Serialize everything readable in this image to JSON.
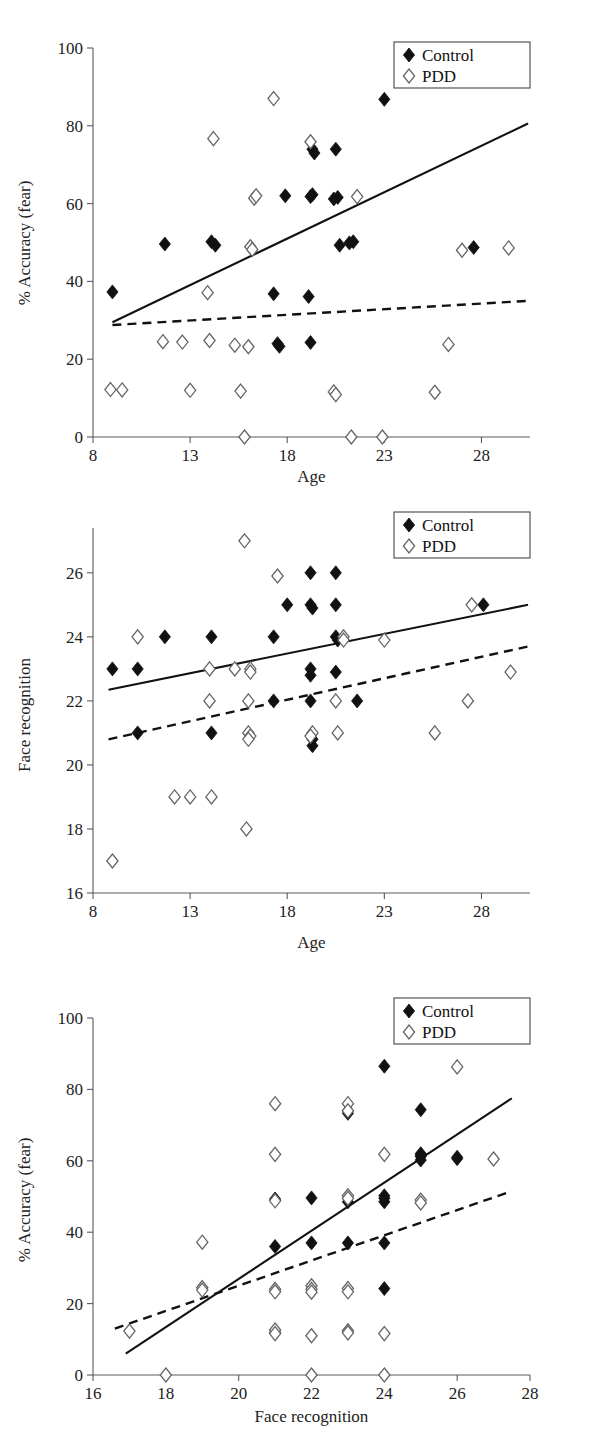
{
  "figure": {
    "panel_count": 3,
    "legend": {
      "control_label": "Control",
      "pdd_label": "PDD",
      "control_marker": "filled-diamond-icon",
      "pdd_marker": "open-diamond-icon"
    },
    "colors": {
      "control": "#111111",
      "pdd_outline": "#666666",
      "axis": "#5a5a5a",
      "background": "#ffffff"
    }
  },
  "chart_data": [
    {
      "id": "panel-1",
      "type": "scatter",
      "title": "",
      "xlabel": "Age",
      "ylabel": "% Accuracy (fear)",
      "xlim": [
        8,
        30.5
      ],
      "ylim": [
        0,
        100
      ],
      "xticks": [
        8,
        13,
        18,
        23,
        28
      ],
      "yticks": [
        0,
        20,
        40,
        60,
        80,
        100
      ],
      "grid": false,
      "legend_position": "top-right",
      "series": [
        {
          "name": "Control",
          "marker": "filled-diamond",
          "points": [
            [
              9.0,
              37.3
            ],
            [
              11.7,
              49.6
            ],
            [
              14.1,
              50.2
            ],
            [
              14.3,
              49.3
            ],
            [
              17.3,
              36.8
            ],
            [
              17.5,
              24.0
            ],
            [
              17.6,
              23.3
            ],
            [
              17.9,
              62.0
            ],
            [
              19.1,
              36.1
            ],
            [
              19.2,
              24.3
            ],
            [
              19.2,
              61.8
            ],
            [
              19.3,
              62.3
            ],
            [
              19.3,
              74.0
            ],
            [
              19.4,
              73.0
            ],
            [
              20.4,
              61.2
            ],
            [
              20.6,
              61.6
            ],
            [
              20.5,
              74.0
            ],
            [
              20.7,
              49.3
            ],
            [
              21.2,
              49.9
            ],
            [
              21.4,
              50.2
            ],
            [
              23.0,
              86.8
            ],
            [
              27.6,
              48.7
            ]
          ]
        },
        {
          "name": "PDD",
          "marker": "open-diamond",
          "points": [
            [
              8.9,
              12.2
            ],
            [
              9.5,
              12.1
            ],
            [
              11.6,
              24.5
            ],
            [
              12.6,
              24.4
            ],
            [
              13.0,
              12.0
            ],
            [
              13.9,
              37.1
            ],
            [
              14.0,
              24.8
            ],
            [
              14.2,
              76.7
            ],
            [
              15.3,
              23.6
            ],
            [
              15.6,
              11.8
            ],
            [
              15.8,
              0.0
            ],
            [
              16.0,
              23.2
            ],
            [
              16.1,
              48.9
            ],
            [
              16.2,
              48.2
            ],
            [
              16.3,
              61.4
            ],
            [
              16.4,
              62.0
            ],
            [
              17.3,
              87.0
            ],
            [
              19.2,
              75.9
            ],
            [
              20.4,
              11.6
            ],
            [
              20.5,
              10.9
            ],
            [
              21.3,
              0.0
            ],
            [
              21.6,
              61.8
            ],
            [
              22.9,
              0.0
            ],
            [
              25.6,
              11.5
            ],
            [
              26.3,
              23.8
            ],
            [
              27.0,
              48.0
            ],
            [
              29.4,
              48.6
            ]
          ]
        }
      ],
      "fit_lines": [
        {
          "group": "Control",
          "style": "solid",
          "x1": 9.0,
          "y1": 29.5,
          "x2": 30.4,
          "y2": 80.6
        },
        {
          "group": "PDD",
          "style": "dashed",
          "x1": 9.0,
          "y1": 28.8,
          "x2": 30.4,
          "y2": 35.0
        }
      ]
    },
    {
      "id": "panel-2",
      "type": "scatter",
      "title": "",
      "xlabel": "Age",
      "ylabel": "Face recognition",
      "xlim": [
        8,
        30.5
      ],
      "ylim": [
        16,
        27.4
      ],
      "xticks": [
        8,
        13,
        18,
        23,
        28
      ],
      "yticks": [
        16,
        18,
        20,
        22,
        24,
        26
      ],
      "grid": false,
      "legend_position": "top-right",
      "series": [
        {
          "name": "Control",
          "marker": "filled-diamond",
          "points": [
            [
              9.0,
              23.0
            ],
            [
              10.3,
              23.0
            ],
            [
              11.7,
              24.0
            ],
            [
              14.1,
              24.0
            ],
            [
              14.1,
              21.0
            ],
            [
              10.3,
              21.0
            ],
            [
              17.3,
              24.0
            ],
            [
              17.3,
              22.0
            ],
            [
              18.0,
              25.0
            ],
            [
              19.2,
              26.0
            ],
            [
              19.2,
              25.0
            ],
            [
              19.3,
              24.9
            ],
            [
              19.2,
              23.0
            ],
            [
              19.2,
              22.8
            ],
            [
              19.2,
              22.0
            ],
            [
              19.3,
              20.8
            ],
            [
              19.3,
              20.6
            ],
            [
              20.5,
              26.0
            ],
            [
              20.5,
              25.0
            ],
            [
              20.5,
              24.0
            ],
            [
              20.6,
              23.9
            ],
            [
              20.5,
              22.9
            ],
            [
              21.6,
              22.0
            ],
            [
              28.1,
              25.0
            ]
          ]
        },
        {
          "name": "PDD",
          "marker": "open-diamond",
          "points": [
            [
              9.0,
              17.0
            ],
            [
              10.3,
              24.0
            ],
            [
              12.2,
              19.0
            ],
            [
              13.0,
              19.0
            ],
            [
              14.1,
              19.0
            ],
            [
              14.0,
              22.0
            ],
            [
              14.0,
              23.0
            ],
            [
              15.3,
              23.0
            ],
            [
              15.8,
              27.0
            ],
            [
              15.9,
              18.0
            ],
            [
              16.0,
              22.0
            ],
            [
              16.1,
              23.0
            ],
            [
              16.1,
              22.9
            ],
            [
              16.0,
              21.0
            ],
            [
              16.1,
              20.9
            ],
            [
              16.0,
              20.8
            ],
            [
              17.5,
              25.9
            ],
            [
              19.3,
              21.0
            ],
            [
              19.2,
              20.9
            ],
            [
              20.5,
              22.0
            ],
            [
              20.6,
              21.0
            ],
            [
              20.9,
              24.0
            ],
            [
              20.9,
              23.9
            ],
            [
              23.0,
              23.9
            ],
            [
              25.6,
              21.0
            ],
            [
              27.3,
              22.0
            ],
            [
              27.5,
              25.0
            ],
            [
              29.5,
              22.9
            ]
          ]
        }
      ],
      "fit_lines": [
        {
          "group": "Control",
          "style": "solid",
          "x1": 8.8,
          "y1": 22.35,
          "x2": 30.4,
          "y2": 25.0
        },
        {
          "group": "PDD",
          "style": "dashed",
          "x1": 8.8,
          "y1": 20.8,
          "x2": 30.4,
          "y2": 23.7
        }
      ]
    },
    {
      "id": "panel-3",
      "type": "scatter",
      "title": "",
      "xlabel": "Face recognition",
      "ylabel": "% Accuracy (fear)",
      "xlim": [
        16,
        28
      ],
      "ylim": [
        0,
        100
      ],
      "xticks": [
        16,
        18,
        20,
        22,
        24,
        26,
        28
      ],
      "yticks": [
        0,
        20,
        40,
        60,
        80,
        100
      ],
      "grid": false,
      "legend_position": "top-right",
      "series": [
        {
          "name": "Control",
          "marker": "filled-diamond",
          "points": [
            [
              21.0,
              36.0
            ],
            [
              21.0,
              49.3
            ],
            [
              21.0,
              11.9
            ],
            [
              22.0,
              49.6
            ],
            [
              22.0,
              37.0
            ],
            [
              23.0,
              74.0
            ],
            [
              23.0,
              73.3
            ],
            [
              23.0,
              37.0
            ],
            [
              24.0,
              86.5
            ],
            [
              24.0,
              49.5
            ],
            [
              24.0,
              48.5
            ],
            [
              24.0,
              37.0
            ],
            [
              24.0,
              24.2
            ],
            [
              25.0,
              74.3
            ],
            [
              25.0,
              62.0
            ],
            [
              25.0,
              61.2
            ],
            [
              25.0,
              60.2
            ],
            [
              26.0,
              61.0
            ],
            [
              26.0,
              60.6
            ],
            [
              23.0,
              48.5
            ],
            [
              24.0,
              50.2
            ],
            [
              25.0,
              61.6
            ]
          ]
        },
        {
          "name": "PDD",
          "marker": "open-diamond",
          "points": [
            [
              17.0,
              12.3
            ],
            [
              18.0,
              0.0
            ],
            [
              19.0,
              37.2
            ],
            [
              19.0,
              24.5
            ],
            [
              19.0,
              23.8
            ],
            [
              21.0,
              76.0
            ],
            [
              21.0,
              61.8
            ],
            [
              21.0,
              48.8
            ],
            [
              21.0,
              24.0
            ],
            [
              21.0,
              23.3
            ],
            [
              21.0,
              12.6
            ],
            [
              21.0,
              11.6
            ],
            [
              22.0,
              25.0
            ],
            [
              22.0,
              24.0
            ],
            [
              22.0,
              23.2
            ],
            [
              22.0,
              11.0
            ],
            [
              22.0,
              0.0
            ],
            [
              23.0,
              76.0
            ],
            [
              23.0,
              74.0
            ],
            [
              23.0,
              50.2
            ],
            [
              23.0,
              49.5
            ],
            [
              23.0,
              24.2
            ],
            [
              23.0,
              23.3
            ],
            [
              23.0,
              12.4
            ],
            [
              23.0,
              11.8
            ],
            [
              24.0,
              61.8
            ],
            [
              24.0,
              11.6
            ],
            [
              24.0,
              0.0
            ],
            [
              25.0,
              49.0
            ],
            [
              25.0,
              48.2
            ],
            [
              26.0,
              86.3
            ],
            [
              27.0,
              60.5
            ]
          ]
        }
      ],
      "fit_lines": [
        {
          "group": "Control",
          "style": "solid",
          "x1": 16.9,
          "y1": 6.0,
          "x2": 27.5,
          "y2": 77.5
        },
        {
          "group": "PDD",
          "style": "dashed",
          "x1": 16.6,
          "y1": 13.0,
          "x2": 27.5,
          "y2": 51.5
        }
      ]
    }
  ]
}
